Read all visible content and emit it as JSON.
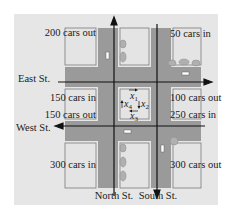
{
  "diagram": {
    "streets": {
      "east": "East St.",
      "west": "West St.",
      "north": "North St.",
      "south": "South St."
    },
    "flows": {
      "top_left": "200 cars out",
      "top_right": "50 cars in",
      "east_left": "150 cars in",
      "east_right": "100 cars out",
      "west_left": "150 cars out",
      "west_right": "250 cars in",
      "bottom_left": "300 cars in",
      "bottom_right": "300 cars out"
    },
    "variables": {
      "x1": "x",
      "x1_sub": "1",
      "x2": "x",
      "x2_sub": "2",
      "x3": "x",
      "x3_sub": "3",
      "x4": "x",
      "x4_sub": "4"
    },
    "colors": {
      "panel": "#e6e6e6",
      "road": "#9a9a9a",
      "block": "#e4e4e4",
      "line": "#111111",
      "car": "#b0b0b0"
    }
  }
}
